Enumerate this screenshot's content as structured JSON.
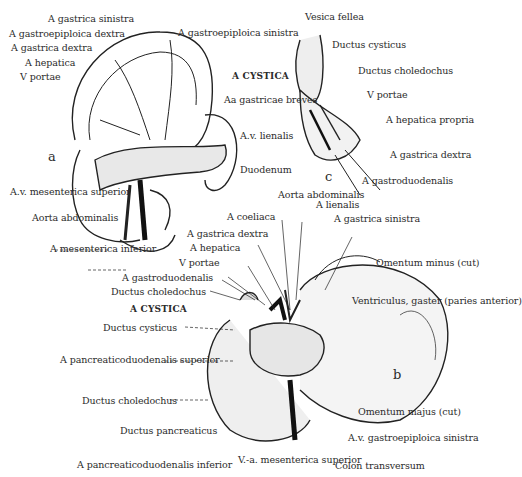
{
  "figure": {
    "panels": [
      {
        "id": "a",
        "label": "a"
      },
      {
        "id": "b",
        "label": "b"
      },
      {
        "id": "c",
        "label": "c"
      }
    ]
  },
  "labels_a": {
    "gastrica_sinistra": "A gastrica sinistra",
    "gastroepiploica_dextra": "A gastroepiploica dextra",
    "gastrica_dextra": "A gastrica dextra",
    "hepatica": "A hepatica",
    "vportae": "V portae",
    "gastroepiploica_sinistra_1": "A gastroepiploica",
    "gastroepiploica_sinistra_2": "sinistra",
    "gastricae_breves_1": "Aa gastricae",
    "gastricae_breves_2": "breves",
    "av_lienalis_1": "A.v.",
    "av_lienalis_2": "lienalis",
    "av_mes_sup_1": "A.v.",
    "av_mes_sup_2": "mesenterica",
    "av_mes_sup_3": "superior",
    "aorta_1": "Aorta",
    "aorta_2": "abdominalis",
    "mes_inf": "A mesenterica inferior"
  },
  "labels_c": {
    "vesica_fellea": "Vesica fellea",
    "ductus_cysticus": "Ductus cysticus",
    "a_cystica": "A CYSTICA",
    "ductus_choledochus": "Ductus choledochus",
    "vportae": "V portae",
    "hepatica_propria_1": "A hepatica",
    "hepatica_propria_2": "propria",
    "gastrica_dextra_1": "A gastrica",
    "gastrica_dextra_2": "dextra",
    "duodenum": "Duodenum",
    "gastroduodenalis": "A gastroduodenalis"
  },
  "labels_b": {
    "aorta_1": "Aorta",
    "aorta_2": "abdominalis",
    "coeliaca": "A coeliaca",
    "lienalis": "A lienalis",
    "gastrica_sinistra": "A gastrica sinistra",
    "gastrica_dextra": "A gastrica dextra",
    "hepatica": "A hepatica",
    "vportae": "V portae",
    "gastroduodenalis": "A gastroduodenalis",
    "ductus_choledochus_top": "Ductus choledochus",
    "a_cystica": "A CYSTICA",
    "ductus_cysticus": "Ductus cysticus",
    "omentum_minus_1": "Omentum minus",
    "omentum_minus_2": "(cut)",
    "ventriculus_1": "Ventriculus, gaster",
    "ventriculus_2": "(paries anterior)",
    "panc_sup_1": "A pancreaticoduodenalis",
    "panc_sup_2": "superior",
    "ductus_choledochus_bottom": "Ductus choledochus",
    "ductus_pancreaticus": "Ductus pancreaticus",
    "panc_inf": "A pancreaticoduodenalis inferior",
    "va_mes_sup_1": "V.-a. mesenterica",
    "va_mes_sup_2": "superior",
    "omentum_majus_1": "Omentum majus",
    "omentum_majus_2": "(cut)",
    "av_gastroepiploica_1": "A.v. gastroepiploica",
    "av_gastroepiploica_2": "sinistra",
    "colon": "Colon transversum"
  }
}
